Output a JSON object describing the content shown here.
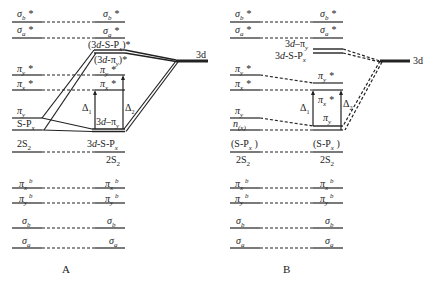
{
  "diagram": {
    "type": "molecular-orbital-energy-level-diagram",
    "panels": [
      {
        "id": "A",
        "caption": "A",
        "left_levels": [
          {
            "label": "σb*",
            "y": 22
          },
          {
            "label": "σa*",
            "y": 38
          },
          {
            "label": "πy*",
            "y": 75
          },
          {
            "label": "πx*",
            "y": 90
          },
          {
            "label": "πy",
            "y": 118
          },
          {
            "label": "S-Px",
            "y": 130
          },
          {
            "label": "2S2",
            "y": 152
          },
          {
            "label": "πx b",
            "y": 188
          },
          {
            "label": "πy b",
            "y": 203
          },
          {
            "label": "σb",
            "y": 228
          },
          {
            "label": "σa",
            "y": 248
          }
        ],
        "right_levels": [
          {
            "label": "σb*",
            "y": 22
          },
          {
            "label": "σa*",
            "y": 38
          },
          {
            "label": "(3d-S-Px)*",
            "y": 50
          },
          {
            "label": "(3d-πy)*",
            "y": 54
          },
          {
            "label": "πy*",
            "y": 75
          },
          {
            "label": "πx*",
            "y": 90
          },
          {
            "label": "3d-πy",
            "y": 130
          },
          {
            "label": "3d-S-Px",
            "y": 152
          },
          {
            "label": "2S2",
            "y": 152
          },
          {
            "label": "πx b",
            "y": 188
          },
          {
            "label": "πy b",
            "y": 203
          },
          {
            "label": "σb",
            "y": 228
          },
          {
            "label": "σa",
            "y": 248
          }
        ],
        "metal_level": {
          "label": "3d"
        },
        "gaps": [
          {
            "label": "Δ1",
            "from": "3d-πy",
            "to": "πx*"
          },
          {
            "label": "Δ2",
            "from": "3d-πy",
            "to": "πy*"
          }
        ]
      },
      {
        "id": "B",
        "caption": "B",
        "left_levels": [
          {
            "label": "σb*",
            "y": 22
          },
          {
            "label": "σa*",
            "y": 38
          },
          {
            "label": "πy*",
            "y": 75
          },
          {
            "label": "πx*",
            "y": 90
          },
          {
            "label": "πy",
            "y": 118
          },
          {
            "label": "n(x)",
            "y": 130
          },
          {
            "label": "(S-Px)",
            "y": 152
          },
          {
            "label": "2S2",
            "y": 152
          },
          {
            "label": "πx b",
            "y": 188
          },
          {
            "label": "πy b",
            "y": 203
          },
          {
            "label": "σb",
            "y": 228
          },
          {
            "label": "σa",
            "y": 248
          }
        ],
        "right_levels": [
          {
            "label": "σb*",
            "y": 22
          },
          {
            "label": "σa*",
            "y": 38
          },
          {
            "label": "3d-πy",
            "y": 49
          },
          {
            "label": "3d-S-Px",
            "y": 53
          },
          {
            "label": "πy*",
            "y": 83
          },
          {
            "label": "πx*",
            "y": 90
          },
          {
            "label": "πy",
            "y": 126
          },
          {
            "label": "(S-Px)",
            "y": 130
          },
          {
            "label": "2S2",
            "y": 152
          },
          {
            "label": "πx b",
            "y": 188
          },
          {
            "label": "πy b",
            "y": 203
          },
          {
            "label": "σb",
            "y": 228
          },
          {
            "label": "σa",
            "y": 248
          }
        ],
        "metal_level": {
          "label": "3d"
        },
        "gaps": [
          {
            "label": "Δ1",
            "from": "πy",
            "to": "πx*"
          },
          {
            "label": "Δ2",
            "from": "(S-Px)",
            "to": "πx*"
          }
        ]
      }
    ]
  },
  "labels": {
    "A": {
      "sb_star_l": "σ",
      "sb_star_l_sub": "b",
      "star": "*",
      "sa_l": "σ",
      "sa_sub": "a",
      "sb_sub": "b",
      "pi": "π",
      "x": "x",
      "y": "y",
      "b": "b",
      "spx": "S-P",
      "spx_sub": "x",
      "two_s": "2S",
      "two_s_sub": "2",
      "cpx_star": "(3d-S-P",
      "cpx_star_close": ")*",
      "cpy_star": "(3d-π",
      "cpy_star_close": ")*",
      "d_pi_y": "3d-π",
      "d_spx": "3d-S-P",
      "delta1": "Δ",
      "delta1_sub": "1",
      "delta2": "Δ",
      "delta2_sub": "2",
      "three_d": "3d",
      "caption": "A"
    },
    "B": {
      "n_x": "n",
      "n_x_sub": "(x)",
      "spx_paren": "(S-P",
      "spx_paren_close": " )",
      "d_pi_y": "3d-π",
      "d_spx": "3d-S-P",
      "three_d": "3d",
      "caption": "B"
    }
  },
  "colors": {
    "line": "#222222",
    "background": "#ffffff"
  }
}
